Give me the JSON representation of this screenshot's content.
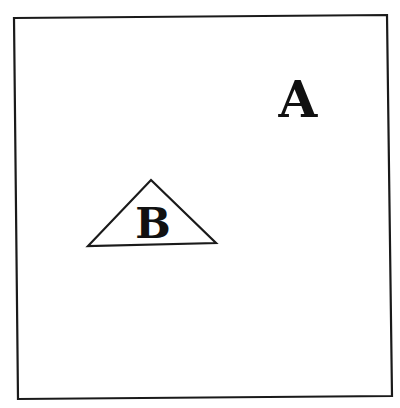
{
  "figure": {
    "background": "#ffffff",
    "stroke_color": "#1a1a1a",
    "frame": {
      "shape": "square",
      "corners": [
        [
          14,
          18
        ],
        [
          387,
          15
        ],
        [
          392,
          396
        ],
        [
          18,
          399
        ]
      ]
    },
    "labels": {
      "a": {
        "text": "A",
        "x": 298,
        "y": 117,
        "font_size": 50
      },
      "b": {
        "text": "B",
        "x": 153,
        "y": 238,
        "font_size": 42
      }
    },
    "triangle": {
      "apex": [
        151,
        180
      ],
      "base_left": [
        88,
        246
      ],
      "base_right": [
        216,
        243
      ],
      "contains_label": "B"
    }
  }
}
